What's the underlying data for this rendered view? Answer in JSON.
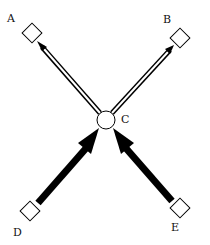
{
  "diagram": {
    "nodes": [
      {
        "id": "A",
        "label": "A",
        "shape": "square",
        "x": 32,
        "y": 33
      },
      {
        "id": "B",
        "label": "B",
        "shape": "square",
        "x": 180,
        "y": 38
      },
      {
        "id": "C",
        "label": "C",
        "shape": "circle",
        "x": 106,
        "y": 120
      },
      {
        "id": "D",
        "label": "D",
        "shape": "square",
        "x": 30,
        "y": 211
      },
      {
        "id": "E",
        "label": "E",
        "shape": "square",
        "x": 180,
        "y": 208
      }
    ],
    "edges": [
      {
        "from": "C",
        "to": "A",
        "style": "hollow-double-line"
      },
      {
        "from": "C",
        "to": "B",
        "style": "hollow-double-line"
      },
      {
        "from": "D",
        "to": "C",
        "style": "thick-filled"
      },
      {
        "from": "E",
        "to": "C",
        "style": "thick-filled"
      }
    ],
    "colors": {
      "stroke": "#000000",
      "fill": "#ffffff"
    }
  }
}
